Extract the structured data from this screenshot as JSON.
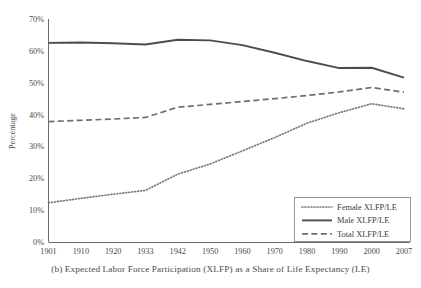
{
  "figure": {
    "caption": "(b) Expected Labor Force Participation (XLFP) as a Share of Life Expectancy (LE)"
  },
  "chart_data": {
    "type": "line",
    "title": "",
    "xlabel": "",
    "ylabel": "Percentage",
    "categories": [
      "1901",
      "1910",
      "1920",
      "1933",
      "1942",
      "1950",
      "1960",
      "1970",
      "1980",
      "1990",
      "2000",
      "2007"
    ],
    "x": [
      1901,
      1910,
      1920,
      1933,
      1942,
      1950,
      1960,
      1970,
      1980,
      1990,
      2000,
      2007
    ],
    "xlim": [
      1901,
      2007
    ],
    "ylim": [
      0,
      70
    ],
    "ytick_labels": [
      "0%",
      "10%",
      "20%",
      "30%",
      "40%",
      "50%",
      "60%",
      "70%"
    ],
    "ytick_values": [
      0,
      10,
      20,
      30,
      40,
      50,
      60,
      70
    ],
    "grid": false,
    "legend_position": "bottom-right",
    "series": [
      {
        "name": "Female XLFP/LE",
        "style": "dotted",
        "color": "#7a7a7a",
        "values": [
          12.3,
          13.7,
          15.0,
          16.2,
          21.3,
          24.5,
          28.6,
          32.8,
          37.3,
          40.6,
          43.4,
          41.8
        ]
      },
      {
        "name": "Male XLFP/LE",
        "style": "solid",
        "color": "#4d4d4d",
        "values": [
          62.5,
          62.6,
          62.4,
          62.0,
          63.5,
          63.3,
          61.8,
          59.4,
          56.8,
          54.6,
          54.7,
          51.6
        ]
      },
      {
        "name": "Total XLFP/LE",
        "style": "dashed",
        "color": "#6e6e6e",
        "values": [
          37.8,
          38.2,
          38.6,
          39.1,
          42.3,
          43.2,
          44.1,
          45.0,
          46.0,
          47.1,
          48.5,
          47.0
        ]
      }
    ]
  },
  "legend": {
    "items": [
      {
        "label": "Female XLFP/LE",
        "style": "dotted"
      },
      {
        "label": "Male XLFP/LE",
        "style": "solid"
      },
      {
        "label": "Total XLFP/LE",
        "style": "dashed"
      }
    ]
  },
  "colors": {
    "axis": "#6b6b6b",
    "female": "#7a7a7a",
    "male": "#4d4d4d",
    "total": "#6e6e6e",
    "text": "#4a4a4a",
    "background": "#ffffff"
  }
}
